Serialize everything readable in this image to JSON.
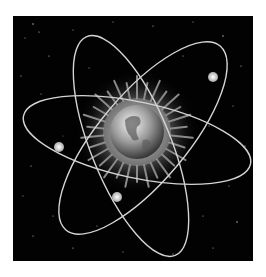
{
  "image": {
    "description": "Atom symbol with Earth globe at nucleus surrounded by sunburst rays, three elliptical orbits with glowing electrons, on starry black background",
    "alt": "Atom with Earth nucleus",
    "colors": {
      "background": "#020202",
      "page": "#ffffff",
      "orbit": "#d8d8d8",
      "electron": "#e6e6e6"
    },
    "electron_count": 3,
    "orbit_count": 3
  }
}
